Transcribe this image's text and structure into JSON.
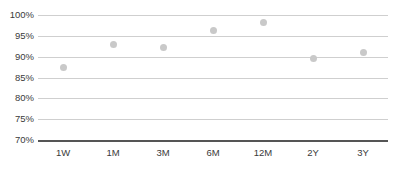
{
  "chart_data": {
    "type": "scatter",
    "title": "",
    "subtitle": "",
    "xlabel": "",
    "ylabel": "",
    "categories": [
      "1W",
      "1M",
      "3M",
      "6M",
      "12M",
      "2Y",
      "3Y"
    ],
    "values": [
      87.5,
      93.0,
      92.1,
      96.2,
      98.1,
      89.6,
      91.1
    ],
    "series": [
      {
        "name": "",
        "values": [
          87.5,
          93.0,
          92.1,
          96.2,
          98.1,
          89.6,
          91.1
        ]
      }
    ],
    "ylim": [
      70,
      100
    ],
    "ytick_labels": [
      "100%",
      "95%",
      "90%",
      "85%",
      "80%",
      "75%",
      "70%"
    ],
    "ytick_values": [
      100,
      95,
      90,
      85,
      80,
      75,
      70
    ],
    "xtick_labels": [
      "1W",
      "1M",
      "3M",
      "6M",
      "12M",
      "2Y",
      "3Y"
    ],
    "grid": true,
    "legend": false,
    "legend_position": "none",
    "marker_color": "#c9c9c9",
    "gridline_color": "#cfcfcf",
    "baseline_color": "#555555",
    "label_color": "#3a3a3a",
    "background_color": "#ffffff"
  }
}
